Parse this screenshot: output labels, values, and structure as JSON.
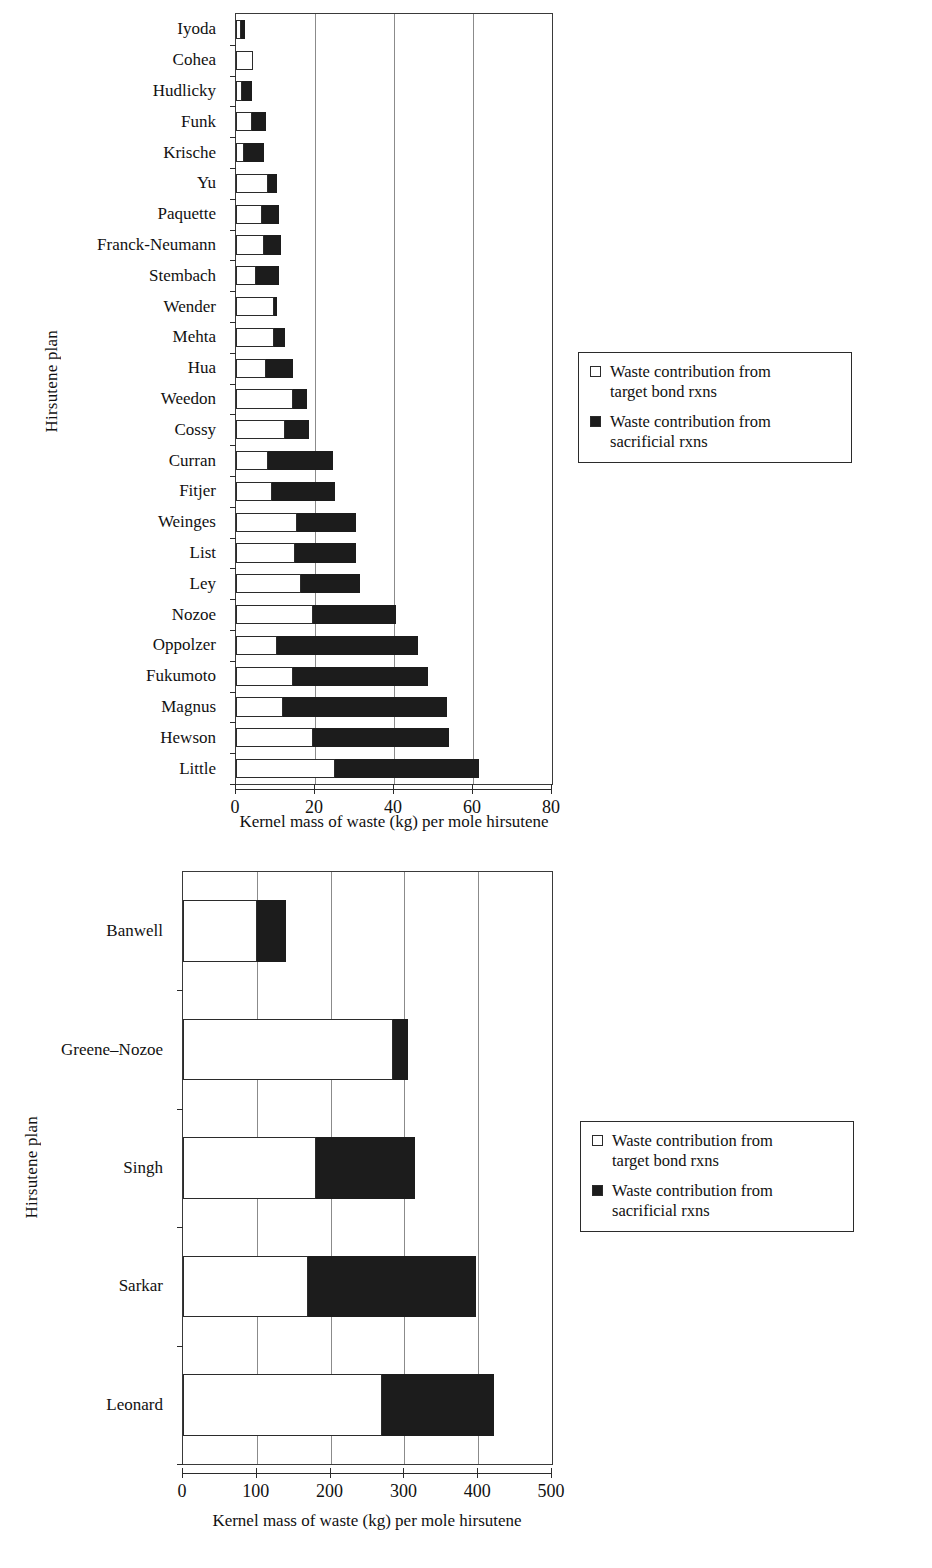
{
  "legend": {
    "items": [
      {
        "marker": "empty-square-icon",
        "label": "Waste contribution from\ntarget bond rxns"
      },
      {
        "marker": "filled-square-icon",
        "label": "Waste contribution from\nsacrificial rxns"
      }
    ]
  },
  "chart_data": [
    {
      "id": "top",
      "type": "bar",
      "orientation": "horizontal",
      "stacked": true,
      "title": "",
      "xlabel": "Kernel mass of waste (kg) per mole hirsutene",
      "ylabel": "Hirsutene plan",
      "xlim": [
        0,
        80
      ],
      "xticks": [
        0,
        20,
        40,
        60,
        80
      ],
      "xtick_labels": [
        "0",
        "20",
        "40",
        "60",
        "80"
      ],
      "grid": "vertical",
      "legend_position": "right",
      "categories": [
        "Iyoda",
        "Cohea",
        "Hudlicky",
        "Funk",
        "Krische",
        "Yu",
        "Paquette",
        "Franck-Neumann",
        "Stembach",
        "Wender",
        "Mehta",
        "Hua",
        "Weedon",
        "Cossy",
        "Curran",
        "Fitjer",
        "Weinges",
        "List",
        "Ley",
        "Nozoe",
        "Oppolzer",
        "Fukumoto",
        "Magnus",
        "Hewson",
        "Little"
      ],
      "series": [
        {
          "name": "Waste contribution from target bond rxns",
          "color": "#ffffff",
          "values": [
            1.2,
            4.3,
            1.5,
            4.0,
            2.0,
            8.0,
            6.5,
            7.0,
            5.0,
            9.5,
            9.5,
            7.5,
            14.5,
            12.5,
            8.0,
            9.0,
            15.5,
            15.0,
            16.5,
            19.5,
            10.5,
            14.5,
            12.0,
            19.5,
            25.0
          ]
        },
        {
          "name": "Waste contribution from sacrificial rxns",
          "color": "#1c1c1c",
          "values": [
            1.1,
            0.0,
            2.5,
            3.5,
            5.0,
            2.5,
            4.5,
            4.5,
            6.0,
            0.8,
            3.0,
            7.0,
            3.5,
            6.0,
            16.5,
            16.0,
            15.0,
            15.5,
            15.0,
            21.0,
            35.5,
            34.0,
            41.5,
            34.5,
            36.5
          ]
        }
      ],
      "totals": [
        2.3,
        4.3,
        4.0,
        7.5,
        7.0,
        10.5,
        11.0,
        11.5,
        11.0,
        10.3,
        12.5,
        14.5,
        18.0,
        18.5,
        24.5,
        25.0,
        30.5,
        30.5,
        31.5,
        40.5,
        46.0,
        48.5,
        53.5,
        54.0,
        61.5
      ]
    },
    {
      "id": "bottom",
      "type": "bar",
      "orientation": "horizontal",
      "stacked": true,
      "title": "",
      "xlabel": "Kernel mass of waste (kg) per mole hirsutene",
      "ylabel": "Hirsutene plan",
      "xlim": [
        0,
        500
      ],
      "xticks": [
        0,
        100,
        200,
        300,
        400,
        500
      ],
      "xtick_labels": [
        "0",
        "100",
        "200",
        "300",
        "400",
        "500"
      ],
      "grid": "vertical",
      "legend_position": "right",
      "categories": [
        "Banwell",
        "Greene–Nozoe",
        "Singh",
        "Sarkar",
        "Leonard"
      ],
      "series": [
        {
          "name": "Waste contribution from target bond rxns",
          "color": "#ffffff",
          "values": [
            100,
            285,
            180,
            170,
            270
          ]
        },
        {
          "name": "Waste contribution from sacrificial rxns",
          "color": "#1c1c1c",
          "values": [
            40,
            20,
            135,
            227,
            152
          ]
        }
      ],
      "totals": [
        140,
        305,
        315,
        397,
        422
      ]
    }
  ]
}
